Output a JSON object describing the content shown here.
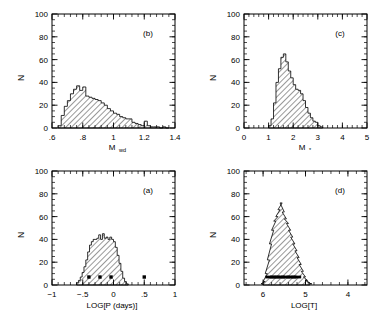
{
  "figure": {
    "background": "#ffffff",
    "ink": "#000000",
    "panel_count": 4
  },
  "chart_data": [
    {
      "type": "bar",
      "panel_label": "(b)",
      "panel_position": "top-left",
      "title": "",
      "xlabel": "M_wd",
      "xlabel_base": "M",
      "xlabel_sub": "wd",
      "ylabel": "N",
      "xlim": [
        0.6,
        1.4
      ],
      "ylim": [
        0,
        100
      ],
      "xticks": [
        0.6,
        0.8,
        1.0,
        1.2,
        1.4
      ],
      "xticklabels": [
        ".6",
        ".8",
        "1",
        "1.2",
        "1.4"
      ],
      "yticks": [
        0,
        20,
        40,
        60,
        80,
        100
      ],
      "yticklabels": [
        "0",
        "20",
        "40",
        "60",
        "80",
        "100"
      ],
      "minor_x_per_major": 5,
      "minor_y_per_major": 4,
      "grid": false,
      "hatch": "diagonal-45",
      "bin_width": 0.02,
      "bin_left_edges": [
        0.64,
        0.66,
        0.68,
        0.7,
        0.72,
        0.74,
        0.76,
        0.78,
        0.8,
        0.82,
        0.84,
        0.86,
        0.88,
        0.9,
        0.92,
        0.94,
        0.96,
        0.98,
        1.0,
        1.02,
        1.04,
        1.06,
        1.08,
        1.1,
        1.12,
        1.14,
        1.16,
        1.18,
        1.2,
        1.22,
        1.24,
        1.26,
        1.28,
        1.3,
        1.32,
        1.34
      ],
      "values": [
        2,
        11,
        19,
        24,
        30,
        34,
        37,
        33,
        36,
        28,
        27,
        26,
        25,
        24,
        22,
        20,
        17,
        15,
        13,
        12,
        10,
        9,
        8,
        8,
        5,
        4,
        3,
        2,
        6,
        2,
        1,
        1,
        1,
        0,
        1,
        0
      ],
      "markers": []
    },
    {
      "type": "bar",
      "panel_label": "(c)",
      "panel_position": "top-right",
      "title": "",
      "xlabel": "M_*",
      "xlabel_base": "M",
      "xlabel_sub": "*",
      "ylabel": "N",
      "xlim": [
        0,
        5
      ],
      "ylim": [
        0,
        100
      ],
      "xticks": [
        0,
        1,
        2,
        3,
        4,
        5
      ],
      "xticklabels": [
        "0",
        "1",
        "2",
        "3",
        "4",
        "5"
      ],
      "yticks": [
        0,
        20,
        40,
        60,
        80,
        100
      ],
      "yticklabels": [
        "0",
        "20",
        "40",
        "60",
        "80",
        "100"
      ],
      "minor_x_per_major": 5,
      "minor_y_per_major": 4,
      "grid": false,
      "hatch": "diagonal-45",
      "bin_width": 0.1,
      "bin_left_edges": [
        1.0,
        1.1,
        1.2,
        1.3,
        1.4,
        1.5,
        1.6,
        1.7,
        1.8,
        1.9,
        2.0,
        2.1,
        2.2,
        2.3,
        2.4,
        2.5,
        2.6,
        2.7,
        2.8,
        2.9,
        3.0,
        3.1
      ],
      "values": [
        2,
        8,
        22,
        40,
        52,
        62,
        65,
        58,
        50,
        44,
        38,
        34,
        33,
        30,
        24,
        18,
        13,
        9,
        6,
        5,
        2,
        1
      ],
      "markers": []
    },
    {
      "type": "bar",
      "panel_label": "(a)",
      "panel_position": "bottom-left",
      "title": "",
      "xlabel": "LOG[P (days)]",
      "ylabel": "N",
      "xlim": [
        -1,
        1
      ],
      "ylim": [
        0,
        100
      ],
      "xticks": [
        -1,
        -0.5,
        0,
        0.5,
        1
      ],
      "xticklabels": [
        "−1",
        "−.5",
        "0",
        ".5",
        "1"
      ],
      "yticks": [
        0,
        20,
        40,
        60,
        80,
        100
      ],
      "yticklabels": [
        "0",
        "20",
        "40",
        "60",
        "80",
        "100"
      ],
      "minor_x_per_major": 5,
      "minor_y_per_major": 4,
      "grid": false,
      "hatch": "diagonal-45",
      "bin_width": 0.03,
      "bin_left_edges": [
        -0.6,
        -0.57,
        -0.54,
        -0.51,
        -0.48,
        -0.45,
        -0.42,
        -0.39,
        -0.36,
        -0.33,
        -0.3,
        -0.27,
        -0.24,
        -0.21,
        -0.18,
        -0.15,
        -0.12,
        -0.09,
        -0.06,
        -0.03,
        0.0,
        0.03,
        0.06,
        0.09,
        0.12,
        0.15,
        0.18,
        0.21
      ],
      "values": [
        2,
        4,
        7,
        11,
        16,
        22,
        29,
        35,
        38,
        40,
        40,
        41,
        44,
        40,
        45,
        41,
        42,
        40,
        42,
        40,
        38,
        33,
        26,
        19,
        12,
        6,
        3,
        1
      ],
      "markers": [
        {
          "x": -0.4,
          "y": 7,
          "shape": "square"
        },
        {
          "x": -0.22,
          "y": 7,
          "shape": "square"
        },
        {
          "x": -0.04,
          "y": 7,
          "shape": "square"
        },
        {
          "x": 0.5,
          "y": 7,
          "shape": "square"
        }
      ]
    },
    {
      "type": "bar",
      "panel_label": "(d)",
      "panel_position": "bottom-right",
      "title": "",
      "xlabel": "LOG[T]",
      "ylabel": "N",
      "xlim": [
        6.45,
        3.55
      ],
      "axis_reversed": true,
      "ylim": [
        0,
        100
      ],
      "xticks": [
        6,
        5,
        4
      ],
      "xticklabels": [
        "6",
        "5",
        "4"
      ],
      "yticks": [
        0,
        20,
        40,
        60,
        80,
        100
      ],
      "yticklabels": [
        "0",
        "20",
        "40",
        "60",
        "80",
        "100"
      ],
      "minor_x_per_major": 5,
      "minor_y_per_major": 4,
      "grid": false,
      "hatch": "diagonal-45",
      "bin_width": 0.05,
      "bin_left_edges": [
        6.0,
        5.95,
        5.9,
        5.85,
        5.8,
        5.75,
        5.7,
        5.65,
        5.6,
        5.55,
        5.5,
        5.45,
        5.4,
        5.35,
        5.3,
        5.25,
        5.2,
        5.15,
        5.1,
        5.05,
        5.0,
        4.95,
        4.9,
        4.85
      ],
      "values": [
        1,
        3,
        10,
        22,
        36,
        48,
        56,
        60,
        66,
        72,
        64,
        58,
        54,
        48,
        42,
        36,
        30,
        24,
        18,
        12,
        7,
        4,
        2,
        1
      ],
      "markers": [
        {
          "x": 5.83,
          "y": 7,
          "shape": "dash"
        },
        {
          "x": 5.72,
          "y": 7,
          "shape": "dash"
        },
        {
          "x": 5.6,
          "y": 7,
          "shape": "dash"
        },
        {
          "x": 5.47,
          "y": 7,
          "shape": "dash"
        },
        {
          "x": 5.33,
          "y": 7,
          "shape": "dash"
        },
        {
          "x": 5.22,
          "y": 7,
          "shape": "dash"
        }
      ]
    }
  ]
}
